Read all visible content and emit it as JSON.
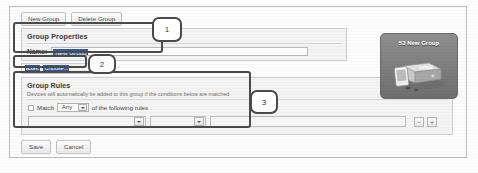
{
  "toolbar": {
    "new_group_label": "New Group",
    "delete_group_label": "Delete Group"
  },
  "group_properties": {
    "title": "Group Properties",
    "name_label": "Name:",
    "name_value": "New Group",
    "name_placeholder": "New Group"
  },
  "icon_row": {
    "label": "Icon:",
    "value": "Choose..."
  },
  "group_rules": {
    "title": "Group Rules",
    "description": "Devices will automatically be added to this group if the conditions below are matched",
    "match_label": "Match",
    "match_select_value": "Any",
    "match_suffix": "of the following rules",
    "rule_row": {
      "field_value": "",
      "operator_value": "",
      "value_value": "",
      "remove_label": "−",
      "add_label": "+"
    }
  },
  "footer": {
    "save_label": "Save",
    "cancel_label": "Cancel"
  },
  "device_card": {
    "title": "53 New Group"
  },
  "annotations": {
    "callout_1": "1",
    "callout_2": "2",
    "callout_3": "3"
  },
  "colors": {
    "selection_blue": "#2f5c9e",
    "annotation_outline": "#4a4a4a",
    "panel_bg": "#f4f4f4",
    "card_gradient_top": "#8f8f8f",
    "card_gradient_bottom": "#6f6f6f"
  }
}
